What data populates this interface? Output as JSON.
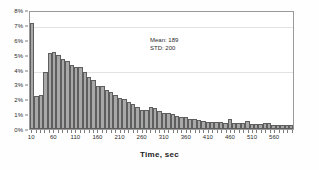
{
  "chart_data": {
    "type": "bar",
    "title": "",
    "subtitle": "",
    "xlabel": "Time, sec",
    "ylabel": "",
    "xlim": [
      10,
      610
    ],
    "ylim": [
      0,
      8
    ],
    "ytick_labels": [
      "0%",
      "1%",
      "2%",
      "3%",
      "4%",
      "5%",
      "6%",
      "7%",
      "8%"
    ],
    "ytick_values": [
      0,
      1,
      2,
      3,
      4,
      5,
      6,
      7,
      8
    ],
    "xtick_labels": [
      "10",
      "60",
      "110",
      "160",
      "210",
      "260",
      "310",
      "360",
      "410",
      "460",
      "510",
      "560"
    ],
    "xtick_values": [
      10,
      60,
      110,
      160,
      210,
      260,
      310,
      360,
      410,
      460,
      510,
      560
    ],
    "bin_width": 10,
    "grid": "horizontal-faint",
    "legend": "none",
    "bar_color": "#a8a8a8",
    "bar_edge_color": "#5e5e5e",
    "categories": [
      10,
      20,
      30,
      40,
      50,
      60,
      70,
      80,
      90,
      100,
      110,
      120,
      130,
      140,
      150,
      160,
      170,
      180,
      190,
      200,
      210,
      220,
      230,
      240,
      250,
      260,
      270,
      280,
      290,
      300,
      310,
      320,
      330,
      340,
      350,
      360,
      370,
      380,
      390,
      400,
      410,
      420,
      430,
      440,
      450,
      460,
      470,
      480,
      490,
      500,
      510,
      520,
      530,
      540,
      550,
      560,
      570,
      580,
      590,
      600
    ],
    "values": [
      7.1,
      2.2,
      2.3,
      3.8,
      5.1,
      5.2,
      5.0,
      4.7,
      4.6,
      4.3,
      4.2,
      4.2,
      3.8,
      3.5,
      3.3,
      2.9,
      2.9,
      2.6,
      2.5,
      2.3,
      2.1,
      2.0,
      1.8,
      1.7,
      1.5,
      1.3,
      1.3,
      1.5,
      1.4,
      1.2,
      1.1,
      1.1,
      1.0,
      0.9,
      0.8,
      0.8,
      0.7,
      0.7,
      0.6,
      0.55,
      0.5,
      0.5,
      0.45,
      0.45,
      0.4,
      0.65,
      0.4,
      0.4,
      0.4,
      0.55,
      0.35,
      0.35,
      0.35,
      0.4,
      0.4,
      0.3,
      0.3,
      0.3,
      0.3,
      0.25
    ],
    "annotations": {
      "mean_label": "Mean: 189",
      "std_label": "STD: 200"
    }
  }
}
